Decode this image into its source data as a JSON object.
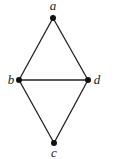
{
  "diagram": {
    "type": "graph",
    "nodes": [
      {
        "id": "a",
        "label": "a",
        "x": 53,
        "y": 18,
        "label_x": 53,
        "label_y": 10,
        "anchor": "middle"
      },
      {
        "id": "b",
        "label": "b",
        "x": 19,
        "y": 80,
        "label_x": 11,
        "label_y": 84,
        "anchor": "middle"
      },
      {
        "id": "d",
        "label": "d",
        "x": 88,
        "y": 80,
        "label_x": 97,
        "label_y": 84,
        "anchor": "middle"
      },
      {
        "id": "c",
        "label": "c",
        "x": 54,
        "y": 143,
        "label_x": 54,
        "label_y": 157,
        "anchor": "middle"
      }
    ],
    "edges": [
      {
        "from": "a",
        "to": "b"
      },
      {
        "from": "a",
        "to": "d"
      },
      {
        "from": "b",
        "to": "d"
      },
      {
        "from": "b",
        "to": "c"
      },
      {
        "from": "d",
        "to": "c"
      }
    ],
    "colors": {
      "stroke": "#222222",
      "node": "#111111",
      "background": "#ffffff"
    }
  }
}
